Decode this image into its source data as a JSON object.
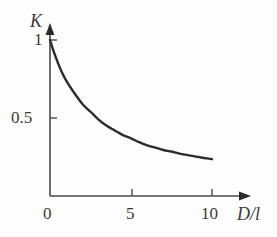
{
  "figure": {
    "background_color": "#fdfdfd",
    "ink_color": "#2b2b2b",
    "text_color": "#3a3a3a"
  },
  "axes": {
    "y_title": "K",
    "x_title": "D/l",
    "y_ticks": [
      {
        "label": "1",
        "value": 1
      },
      {
        "label": "0.5",
        "value": 0.5
      }
    ],
    "x_ticks": [
      {
        "label": "0",
        "value": 0
      },
      {
        "label": "5",
        "value": 5
      },
      {
        "label": "10",
        "value": 10
      }
    ]
  },
  "chart_data": {
    "type": "line",
    "title": "",
    "xlabel": "D/l",
    "ylabel": "K",
    "xlim": [
      0,
      11.5
    ],
    "ylim": [
      0,
      1.12
    ],
    "grid": false,
    "legend": null,
    "x_tick_labels": [
      "0",
      "5",
      "10"
    ],
    "x_tick_values": [
      0,
      5,
      10
    ],
    "y_tick_labels": [
      "1",
      "0.5"
    ],
    "y_tick_values": [
      1,
      0.5
    ],
    "series": [
      {
        "name": "K",
        "x": [
          0.0,
          0.25,
          0.5,
          0.75,
          1.0,
          1.5,
          2.0,
          2.5,
          3.0,
          3.5,
          4.0,
          4.5,
          5.0,
          5.5,
          6.0,
          6.5,
          7.0,
          7.5,
          8.0,
          8.5,
          9.0,
          9.5,
          10.0
        ],
        "values": [
          1.0,
          0.92,
          0.85,
          0.79,
          0.74,
          0.66,
          0.59,
          0.54,
          0.49,
          0.45,
          0.42,
          0.39,
          0.37,
          0.345,
          0.325,
          0.31,
          0.295,
          0.285,
          0.272,
          0.262,
          0.252,
          0.244,
          0.236
        ]
      }
    ]
  }
}
